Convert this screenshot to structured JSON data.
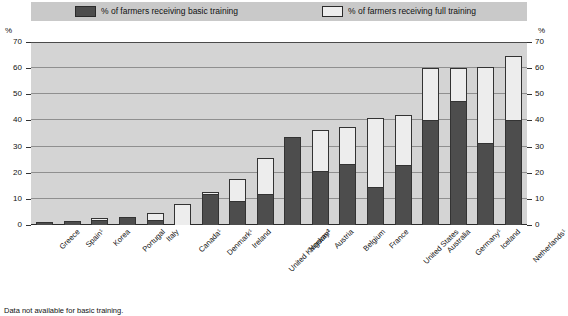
{
  "legend": {
    "basic": {
      "label": "% of farmers receiving basic training",
      "color": "#4d4d4d"
    },
    "full": {
      "label": "% of farmers receiving full training",
      "color": "#ededed"
    }
  },
  "axis": {
    "unit_left": "%",
    "unit_right": "%",
    "ticks": [
      "70",
      "60",
      "50",
      "40",
      "30",
      "20",
      "10",
      "0"
    ]
  },
  "footnote": "Data not available for basic training.",
  "chart_data": {
    "type": "bar",
    "title": "",
    "xlabel": "",
    "ylabel": "%",
    "ylim": [
      0,
      70
    ],
    "grid": true,
    "stacked": true,
    "legend_position": "top",
    "categories": [
      "Greece",
      "Spain¹",
      "Korea",
      "Portugal",
      "Italy",
      "Canada¹",
      "Denmark¹",
      "Ireland",
      "United Kingdom¹",
      "Norway²",
      "Austria",
      "Belgium",
      "France",
      "United States",
      "Australia",
      "Germany¹",
      "Iceland",
      "Netherlands¹"
    ],
    "series": [
      {
        "name": "% of farmers receiving basic training",
        "color": "#4d4d4d",
        "values": [
          1,
          1.5,
          2,
          3,
          2,
          0,
          12,
          9,
          12,
          33.5,
          20.5,
          23.5,
          14.5,
          23,
          40,
          47.5,
          31.5,
          40
        ]
      },
      {
        "name": "% of farmers receiving full training",
        "color": "#ededed",
        "values": [
          0,
          0,
          0.5,
          0,
          2.5,
          8,
          0.5,
          8.5,
          13.5,
          0,
          16,
          14,
          26.5,
          19,
          20,
          12.5,
          29,
          24.5
        ]
      }
    ],
    "totals": [
      1,
      1.5,
      2.5,
      3,
      4.5,
      8,
      12.5,
      17.5,
      25.5,
      33.5,
      36.5,
      37.5,
      41,
      42,
      60,
      60,
      60.5,
      64.5
    ]
  }
}
